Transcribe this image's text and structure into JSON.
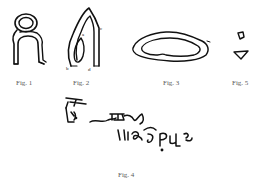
{
  "plate": {
    "figures": [
      {
        "id": "fig1",
        "caption": "Fig. 1",
        "description": "looped anthropomorphic outline"
      },
      {
        "id": "fig2",
        "caption": "Fig. 2",
        "description": "arched outline with inner loop and small letter marks"
      },
      {
        "id": "fig3",
        "caption": "Fig. 3",
        "description": "elongated double-lined oval outline"
      },
      {
        "id": "fig5",
        "caption": "Fig. 5",
        "description": "two small fragments: quadrilateral and triangle"
      },
      {
        "id": "fig4",
        "caption": "Fig. 4",
        "description": "two lines of cursive script inscription"
      }
    ],
    "annotations": {
      "fig2_marks": [
        "a",
        "b",
        "c",
        "d"
      ]
    },
    "colors": {
      "ink": "#111111",
      "caption": "#5a5a5a",
      "background": "#ffffff"
    }
  }
}
